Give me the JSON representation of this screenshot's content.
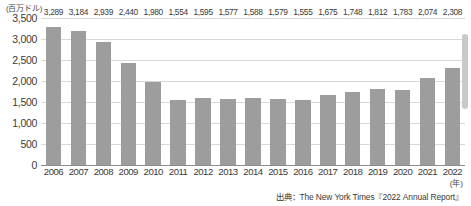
{
  "chart_data": {
    "type": "bar",
    "title": "",
    "xlabel": "(年)",
    "ylabel": "(百万ドル)",
    "ylim": [
      0,
      3500
    ],
    "ytick_labels": [
      "3,500",
      "3,000",
      "2,500",
      "2,000",
      "1,500",
      "1,000",
      "500",
      "0"
    ],
    "ytick_values": [
      3500,
      3000,
      2500,
      2000,
      1500,
      1000,
      500,
      0
    ],
    "grid": true,
    "legend": "none",
    "categories": [
      "2006",
      "2007",
      "2008",
      "2009",
      "2010",
      "2011",
      "2012",
      "2013",
      "2014",
      "2015",
      "2016",
      "2017",
      "2018",
      "2019",
      "2020",
      "2021",
      "2022"
    ],
    "values": [
      3289,
      3184,
      2939,
      2440,
      1980,
      1554,
      1595,
      1577,
      1588,
      1579,
      1555,
      1675,
      1748,
      1812,
      1783,
      2074,
      2308
    ],
    "value_labels": [
      "3,289",
      "3,184",
      "2,939",
      "2,440",
      "1,980",
      "1,554",
      "1,595",
      "1,577",
      "1,588",
      "1,579",
      "1,555",
      "1,675",
      "1,748",
      "1,812",
      "1,783",
      "2,074",
      "2,308"
    ],
    "bar_color": "#9d9d9d",
    "gridline_color": "#d8d8d8",
    "axis_color": "#8d8d8d"
  },
  "source": {
    "text": "出典：The New York Times『2022 Annual Report』"
  },
  "scrollbar": {
    "name": "vertical-scrollbar"
  }
}
